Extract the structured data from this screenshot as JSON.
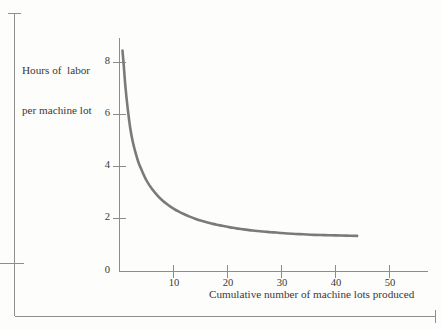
{
  "figure": {
    "name": "learning-curve-figure",
    "background_color": "#fdfdfc",
    "curve_color": "#7a7a7a",
    "axis_color": "#8c8c8c",
    "text_color": "#3a3836",
    "border_color": "#8f8f8f"
  },
  "chart_data": {
    "type": "line",
    "title": "",
    "subtitle": "",
    "xlabel": "Cumulative number of machine lots produced",
    "ylabel": "Hours of  labor\nper machine lot",
    "ylabel_line1": "Hours of  labor",
    "ylabel_line2": "per machine lot",
    "xlim": [
      0,
      57
    ],
    "ylim": [
      0,
      9
    ],
    "xticks": [
      10,
      20,
      30,
      40,
      50
    ],
    "xticklabels": [
      "10",
      "20",
      "30",
      "40",
      "50"
    ],
    "yticks": [
      0,
      2,
      4,
      6,
      8
    ],
    "yticklabels": [
      "0",
      "2",
      "4",
      "6",
      "8"
    ],
    "grid": false,
    "legend": null,
    "legend_position": "none",
    "annotations": [],
    "series": [
      {
        "name": "Labor hours per machine lot",
        "color": "#7a7a7a",
        "x": [
          0.55,
          0.8,
          1.1,
          1.5,
          2,
          2.5,
          3,
          3.5,
          4,
          5,
          6,
          7,
          8,
          9,
          10,
          11,
          12,
          13,
          14,
          15,
          16,
          17,
          18,
          19,
          20,
          21,
          22,
          23,
          24,
          25,
          26,
          27,
          28,
          29,
          30,
          32,
          34,
          36,
          38,
          40,
          42,
          44
        ],
        "y": [
          8.5,
          7.9,
          7.1,
          6.3,
          5.5,
          4.95,
          4.55,
          4.2,
          3.95,
          3.5,
          3.18,
          2.93,
          2.72,
          2.56,
          2.42,
          2.3,
          2.2,
          2.11,
          2.03,
          1.96,
          1.9,
          1.85,
          1.8,
          1.76,
          1.72,
          1.68,
          1.65,
          1.62,
          1.59,
          1.57,
          1.55,
          1.53,
          1.51,
          1.5,
          1.48,
          1.45,
          1.43,
          1.41,
          1.4,
          1.39,
          1.38,
          1.37
        ]
      }
    ]
  },
  "page_border": {
    "name": "page-border-marks",
    "description": "printed page crop marks"
  }
}
